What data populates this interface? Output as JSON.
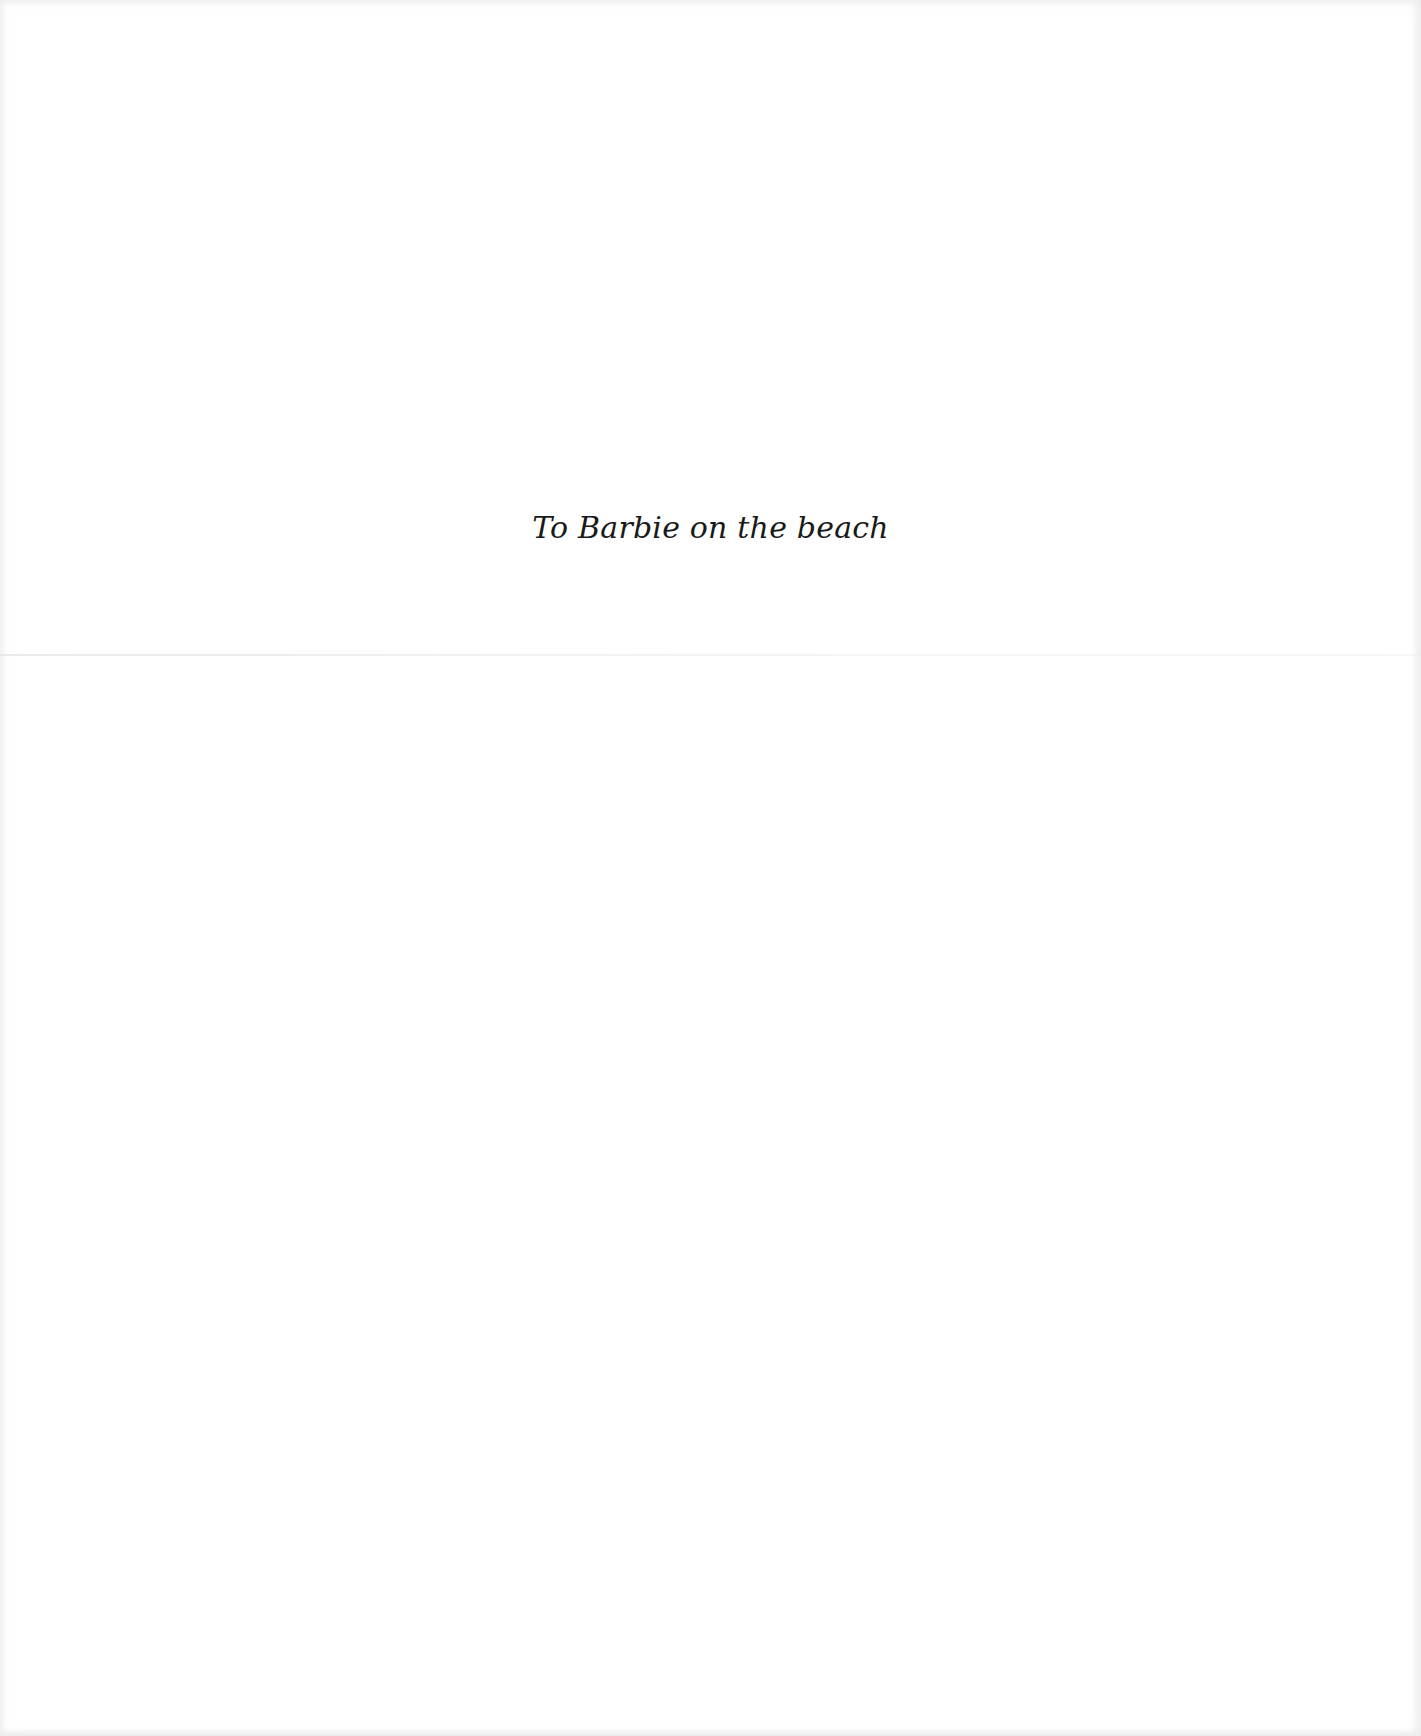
{
  "page": {
    "type": "dedication",
    "dedication_text": "To Barbie on the beach",
    "colors": {
      "paper": "#ffffff",
      "text": "#1a1a1a",
      "fold": "#dcdcdc"
    }
  }
}
